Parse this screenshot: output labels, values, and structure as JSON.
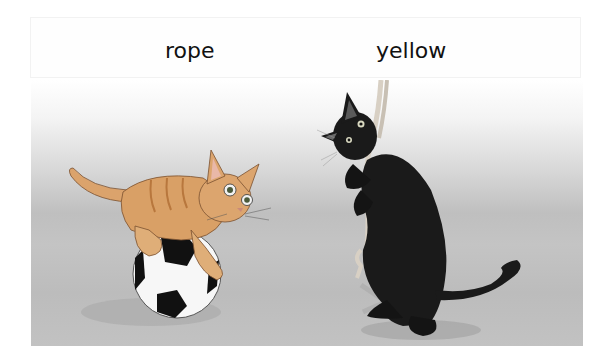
{
  "labels": {
    "words": [
      "rope",
      "yellow"
    ]
  },
  "scene": {
    "description": "Illustration of an orange tabby kitten crouching on a black and white soccer ball, and a black cat standing on its hind legs clutching a hanging rope, on a grey gradient floor",
    "colors": {
      "floor_top": "#ffffff",
      "floor_mid": "#bfbfbf",
      "kitten": "#d9a066",
      "kitten_stripe": "#b8773d",
      "black_cat": "#1a1a1a",
      "ball_white": "#f7f7f7",
      "ball_black": "#111111",
      "rope": "#d8d0c4",
      "shadow": "#9e9e9e"
    }
  }
}
